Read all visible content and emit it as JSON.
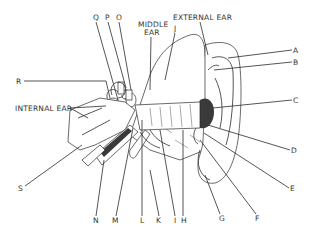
{
  "diagram": {
    "section_labels": {
      "external_ear": "EXTERNAL EAR",
      "middle_ear_line1": "MIDDLE",
      "middle_ear_line2": "EAR",
      "internal_ear": "INTERNAL EAR"
    },
    "callouts": {
      "A": "A",
      "B": "B",
      "C": "C",
      "D": "D",
      "E": "E",
      "F": "F",
      "G": "G",
      "H": "H",
      "I": "I",
      "J": "J",
      "K": "K",
      "L": "L",
      "M": "M",
      "N": "N",
      "O": "O",
      "P": "P",
      "Q": "Q",
      "R": "R",
      "S": "S"
    },
    "colors": {
      "ink": "#2b2b2b",
      "label": "#333333",
      "background": "#ffffff"
    }
  }
}
